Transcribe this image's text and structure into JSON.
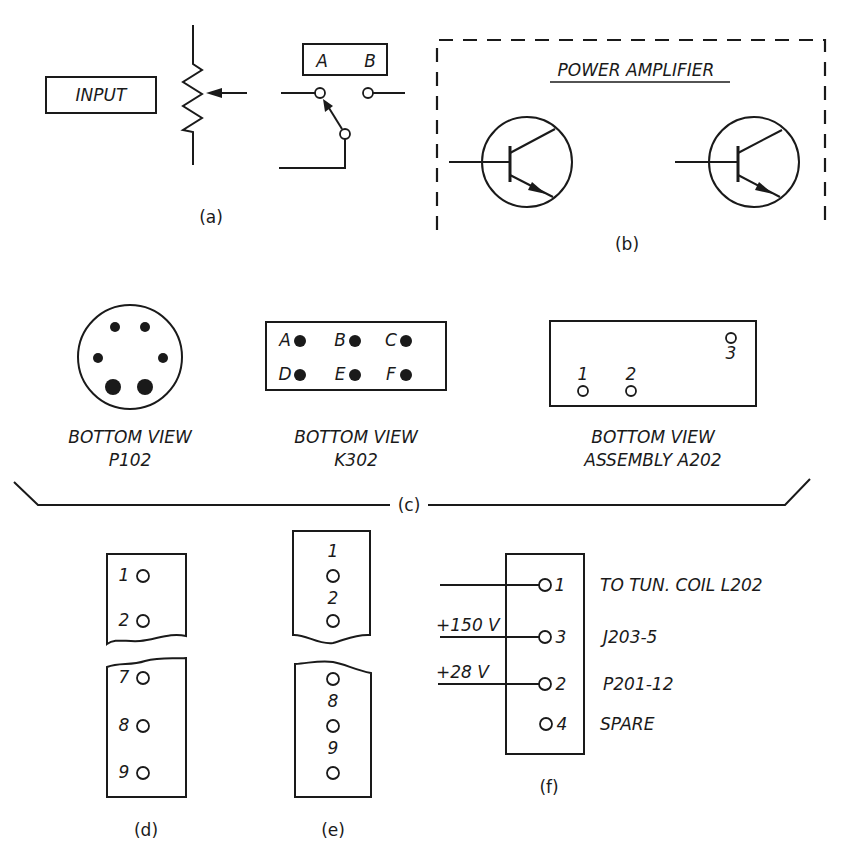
{
  "figure": {
    "panel_a": {
      "caption": "(a)",
      "input_label": "INPUT",
      "switch_labels": [
        "A",
        "B"
      ]
    },
    "panel_b": {
      "caption": "(b)",
      "title": "POWER AMPLIFIER",
      "transistor_count": 2
    },
    "panel_c": {
      "caption": "(c)",
      "views": [
        {
          "line1": "BOTTOM VIEW",
          "line2": "P102"
        },
        {
          "line1": "BOTTOM VIEW",
          "line2": "K302",
          "pins": [
            "A",
            "B",
            "C",
            "D",
            "E",
            "F"
          ]
        },
        {
          "line1": "BOTTOM VIEW",
          "line2": "ASSEMBLY A202",
          "pins": [
            "1",
            "2",
            "3"
          ]
        }
      ]
    },
    "panel_d": {
      "caption": "(d)",
      "pins_top": [
        "1",
        "2"
      ],
      "pins_bottom": [
        "7",
        "8",
        "9"
      ]
    },
    "panel_e": {
      "caption": "(e)",
      "pins_top": [
        "1",
        "2"
      ],
      "pins_bottom": [
        "8",
        "9"
      ]
    },
    "panel_f": {
      "caption": "(f)",
      "terminals": [
        {
          "pin": "1",
          "wire_label": "",
          "destination": "TO TUN. COIL L202"
        },
        {
          "pin": "3",
          "wire_label": "+150 V",
          "destination": "J203-5"
        },
        {
          "pin": "2",
          "wire_label": "+28 V",
          "destination": "P201-12"
        },
        {
          "pin": "4",
          "wire_label": "",
          "destination": "SPARE"
        }
      ]
    }
  }
}
